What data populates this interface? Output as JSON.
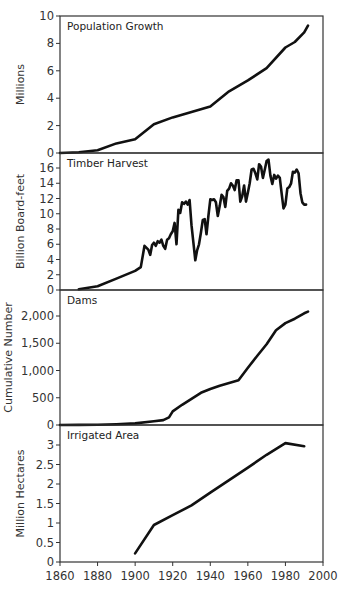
{
  "chart_data": [
    {
      "type": "line",
      "title": "Population Growth",
      "xlabel": "",
      "ylabel": "Millions",
      "ylim": [
        0,
        10
      ],
      "yticks": [
        0,
        2,
        4,
        6,
        8,
        10
      ],
      "xlim": [
        1860,
        2000
      ],
      "x": [
        1860,
        1870,
        1880,
        1890,
        1900,
        1910,
        1920,
        1930,
        1940,
        1950,
        1960,
        1970,
        1980,
        1985,
        1990,
        1992
      ],
      "values": [
        0.0,
        0.05,
        0.2,
        0.7,
        1.0,
        2.1,
        2.6,
        3.0,
        3.4,
        4.5,
        5.3,
        6.2,
        7.7,
        8.1,
        8.8,
        9.3
      ]
    },
    {
      "type": "line",
      "title": "Timber Harvest",
      "xlabel": "",
      "ylabel": "Billion Board-feet",
      "ylim": [
        0,
        17
      ],
      "yticks": [
        0,
        2,
        4,
        6,
        8,
        10,
        12,
        14,
        16
      ],
      "xlim": [
        1860,
        2000
      ],
      "x": [
        1870,
        1880,
        1890,
        1900,
        1903,
        1905,
        1907,
        1908,
        1909,
        1910,
        1911,
        1912,
        1913,
        1914,
        1915,
        1916,
        1917,
        1918,
        1919,
        1920,
        1921,
        1922,
        1923,
        1924,
        1925,
        1926,
        1927,
        1928,
        1929,
        1930,
        1931,
        1932,
        1933,
        1934,
        1935,
        1936,
        1937,
        1938,
        1939,
        1940,
        1941,
        1942,
        1943,
        1944,
        1945,
        1946,
        1947,
        1948,
        1949,
        1950,
        1951,
        1952,
        1953,
        1954,
        1955,
        1956,
        1957,
        1958,
        1959,
        1960,
        1961,
        1962,
        1963,
        1964,
        1965,
        1966,
        1967,
        1968,
        1969,
        1970,
        1971,
        1972,
        1973,
        1974,
        1975,
        1976,
        1977,
        1978,
        1979,
        1980,
        1981,
        1982,
        1983,
        1984,
        1985,
        1986,
        1987,
        1988,
        1989,
        1990,
        1991
      ],
      "values": [
        0.1,
        0.5,
        1.5,
        2.5,
        3.0,
        5.8,
        5.3,
        4.6,
        5.9,
        6.2,
        5.8,
        6.4,
        6.2,
        6.6,
        5.8,
        5.4,
        6.6,
        6.8,
        7.3,
        7.7,
        8.8,
        6.0,
        10.5,
        10.1,
        11.5,
        11.3,
        11.6,
        11.2,
        11.8,
        8.5,
        6.2,
        3.9,
        5.2,
        6.0,
        7.5,
        9.2,
        9.3,
        7.3,
        9.7,
        11.9,
        11.8,
        11.9,
        11.5,
        9.7,
        11.0,
        12.5,
        12.2,
        10.9,
        13.0,
        13.3,
        14.0,
        13.7,
        13.1,
        14.4,
        14.4,
        11.6,
        12.3,
        13.7,
        11.6,
        12.8,
        14.0,
        15.8,
        15.9,
        15.3,
        14.5,
        16.5,
        16.2,
        14.7,
        15.8,
        16.9,
        17.1,
        15.0,
        13.9,
        15.1,
        14.6,
        15.0,
        14.7,
        12.6,
        10.7,
        11.2,
        13.3,
        13.5,
        14.0,
        15.5,
        15.4,
        15.8,
        15.3,
        12.7,
        11.5,
        11.2,
        11.2
      ]
    },
    {
      "type": "line",
      "title": "Dams",
      "xlabel": "",
      "ylabel": "Cumulative Number",
      "ylim": [
        0,
        2300
      ],
      "yticks": [
        0,
        500,
        1000,
        1500,
        2000
      ],
      "ytick_labels": [
        "0",
        "500",
        "1,000",
        "1,500",
        "2,000"
      ],
      "xlim": [
        1860,
        2000
      ],
      "x": [
        1860,
        1870,
        1880,
        1890,
        1900,
        1910,
        1915,
        1918,
        1920,
        1925,
        1930,
        1935,
        1940,
        1945,
        1950,
        1955,
        1960,
        1965,
        1970,
        1975,
        1980,
        1985,
        1990,
        1992
      ],
      "values": [
        0,
        2,
        5,
        15,
        30,
        70,
        90,
        140,
        250,
        370,
        480,
        590,
        660,
        720,
        770,
        820,
        1050,
        1270,
        1480,
        1740,
        1870,
        1950,
        2050,
        2080
      ]
    },
    {
      "type": "line",
      "title": "Irrigated Area",
      "xlabel": "",
      "ylabel": "Million Hectares",
      "ylim": [
        0,
        3.3
      ],
      "yticks": [
        0,
        0.5,
        1,
        1.5,
        2,
        2.5,
        3
      ],
      "ytick_labels": [
        "0",
        "0.5",
        "1",
        "1.5",
        "2",
        "2.5",
        "3"
      ],
      "xlim": [
        1860,
        2000
      ],
      "x": [
        1900,
        1910,
        1920,
        1930,
        1940,
        1950,
        1960,
        1970,
        1980,
        1990
      ],
      "values": [
        0.22,
        0.95,
        1.2,
        1.45,
        1.78,
        2.1,
        2.42,
        2.75,
        3.05,
        2.97
      ]
    }
  ],
  "xaxis": {
    "ticks": [
      1860,
      1880,
      1900,
      1920,
      1940,
      1960,
      1980,
      2000
    ],
    "labels": [
      "1860",
      "1880",
      "1900",
      "1920",
      "1940",
      "1960",
      "1980",
      "2000"
    ]
  }
}
